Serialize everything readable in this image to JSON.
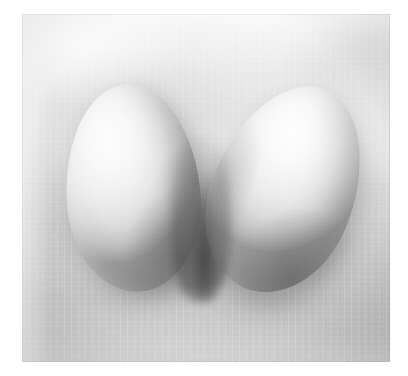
{
  "page": {
    "kind": "photograph",
    "background_color": "#ffffff",
    "width": 408,
    "height": 376
  },
  "photo": {
    "subject": "two white eggs",
    "orientation": "landscape",
    "frame": {
      "left": 22,
      "top": 14,
      "width": 368,
      "height": 348
    },
    "surface": {
      "name": "soft cloudy fabric backdrop",
      "top_tone": "#f4f4f4",
      "mid_tone": "#d8d8d8",
      "bottom_tone": "#c2c2c2"
    },
    "lighting": {
      "direction": "upper-left",
      "quality": "soft diffuse",
      "highlight_color": "#fdfdfd",
      "shadow_color": "#5a5a5a"
    },
    "palette": {
      "paper_white": "#ffffff",
      "egg_highlight": "#fdfdfd",
      "egg_midtone": "#e7e7e7",
      "egg_terminator": "#ababab",
      "contact_shadow": "#5a5a5a",
      "backdrop_light": "#f4f4f4",
      "backdrop_dark": "#c2c2c2"
    },
    "objects": [
      {
        "id": "egg-left",
        "label": "left egg",
        "shape": "ovoid",
        "rotation_deg": -4,
        "left": 44,
        "top": 70,
        "width": 134,
        "height": 208,
        "highlight_position": "upper-left",
        "shadow_position": "lower-right"
      },
      {
        "id": "egg-right",
        "label": "right egg",
        "shape": "ovoid",
        "rotation_deg": 22,
        "left": 192,
        "top": 68,
        "width": 142,
        "height": 214,
        "highlight_position": "upper-left",
        "shadow_position": "lower-right"
      }
    ],
    "features": [
      {
        "id": "crevice",
        "label": "shadowed gap between the eggs",
        "tone": "#3c3c3c"
      },
      {
        "id": "under-shadow",
        "label": "cast shadow pooling beneath the eggs",
        "tone": "#6e6e6e"
      },
      {
        "id": "vignette",
        "label": "soft edge darkening of the print"
      },
      {
        "id": "grain",
        "label": "film grain texture"
      }
    ]
  }
}
